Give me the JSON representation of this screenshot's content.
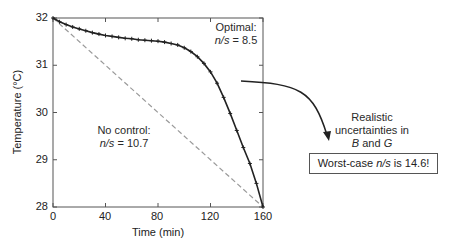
{
  "chart_data": {
    "type": "line",
    "title": "",
    "xlabel": "Time (min)",
    "ylabel": "Temperature (°C)",
    "xlim": [
      0,
      160
    ],
    "ylim": [
      28,
      32
    ],
    "x_ticks": [
      0,
      40,
      80,
      120,
      160
    ],
    "y_ticks": [
      28,
      29,
      30,
      31,
      32
    ],
    "grid": false,
    "legend": null,
    "series": [
      {
        "name": "Optimal",
        "style": "solid line with + markers",
        "color": "#222222",
        "annotation": "Optimal: n/s = 8.5",
        "x": [
          0,
          5,
          10,
          15,
          20,
          25,
          30,
          35,
          40,
          45,
          50,
          55,
          60,
          65,
          70,
          75,
          80,
          85,
          90,
          95,
          100,
          105,
          110,
          115,
          120,
          125,
          130,
          135,
          140,
          145,
          150,
          155,
          160
        ],
        "y": [
          32.0,
          31.92,
          31.86,
          31.81,
          31.77,
          31.73,
          31.69,
          31.66,
          31.63,
          31.61,
          31.59,
          31.57,
          31.56,
          31.54,
          31.53,
          31.52,
          31.51,
          31.49,
          31.46,
          31.43,
          31.37,
          31.29,
          31.18,
          31.04,
          30.86,
          30.62,
          30.32,
          29.98,
          29.62,
          29.26,
          28.92,
          28.5,
          28.0
        ]
      },
      {
        "name": "No control",
        "style": "dashed line",
        "color": "#999999",
        "annotation": "No control: n/s = 10.7",
        "x": [
          0,
          160
        ],
        "y": [
          32.0,
          28.0
        ]
      }
    ],
    "annotations": [
      {
        "text": "Optimal: n/s = 8.5"
      },
      {
        "text": "No control: n/s = 10.7"
      },
      {
        "text": "Realistic uncertainties in B and G",
        "arrow": "from curve to box"
      },
      {
        "text": "Worst-case n/s is 14.6!",
        "boxed": true
      }
    ]
  },
  "axes": {
    "x_label": "Time (min)",
    "y_label": "Temperature (°C)",
    "x_ticks": [
      "0",
      "40",
      "80",
      "120",
      "160"
    ],
    "y_ticks": [
      "32",
      "31",
      "30",
      "29",
      "28"
    ]
  },
  "labels": {
    "optimal_title": "Optimal:",
    "optimal_ns_var": "n/s",
    "optimal_ns_val": " = 8.5",
    "nocontrol_title": "No control:",
    "nocontrol_ns_var": "n/s",
    "nocontrol_ns_val": " = 10.7",
    "uncert_line1": "Realistic",
    "uncert_line2": "uncertainties in",
    "uncert_b": "B",
    "uncert_and": " and ",
    "uncert_g": "G",
    "worst_pre": "Worst-case ",
    "worst_var": "n/s",
    "worst_post": " is 14.6!"
  },
  "colors": {
    "axis": "#555555",
    "optimal": "#222222",
    "nocontrol": "#9a9a9a",
    "arrow": "#222222"
  }
}
